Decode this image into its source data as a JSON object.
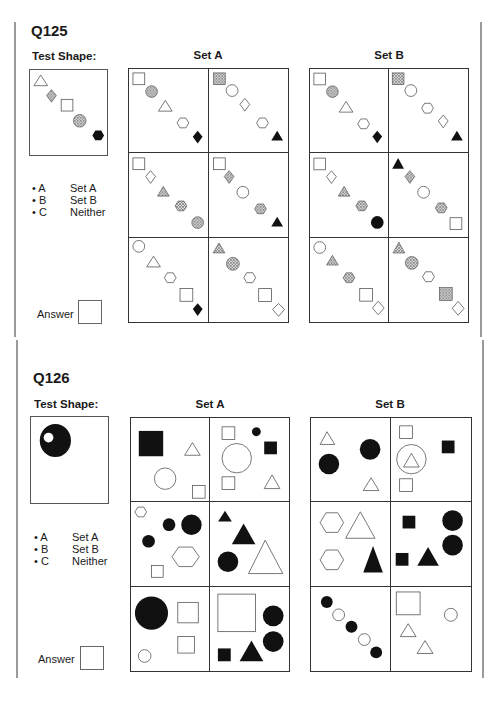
{
  "questions": [
    {
      "id": "Q125",
      "title": "Q125",
      "test_label": "Test Shape:",
      "set_a_label": "Set A",
      "set_b_label": "Set B",
      "test_shape": [
        "triangle-outline",
        "diamond-dotted",
        "square-outline",
        "circle-dotted",
        "hexagon-black"
      ],
      "set_a": [
        [
          "square-outline",
          "circle-dotted",
          "triangle-outline",
          "hexagon-outline",
          "diamond-black"
        ],
        [
          "square-dotted",
          "circle-outline",
          "diamond-outline",
          "hexagon-outline",
          "triangle-black"
        ],
        [
          "square-outline",
          "diamond-outline",
          "triangle-dotted",
          "hexagon-dotted",
          "circle-dotted"
        ],
        [
          "square-outline",
          "diamond-dotted",
          "circle-outline",
          "hexagon-dotted",
          "triangle-black"
        ],
        [
          "circle-outline",
          "triangle-outline",
          "hexagon-outline",
          "square-outline",
          "diamond-black"
        ],
        [
          "triangle-dotted",
          "circle-dotted",
          "hexagon-outline",
          "square-outline",
          "diamond-outline"
        ]
      ],
      "set_b": [
        [
          "square-outline",
          "circle-dotted",
          "triangle-outline",
          "hexagon-outline",
          "diamond-black"
        ],
        [
          "square-dotted",
          "circle-outline",
          "hexagon-outline",
          "diamond-outline",
          "triangle-black"
        ],
        [
          "square-outline",
          "diamond-outline",
          "triangle-dotted",
          "hexagon-dotted",
          "circle-black"
        ],
        [
          "triangle-black",
          "diamond-dotted",
          "circle-outline",
          "hexagon-dotted",
          "square-outline"
        ],
        [
          "circle-outline",
          "triangle-dotted",
          "hexagon-dotted",
          "square-outline",
          "diamond-outline"
        ],
        [
          "triangle-dotted",
          "circle-dotted",
          "hexagon-outline",
          "square-dotted",
          "diamond-outline"
        ]
      ],
      "options": [
        {
          "key": "• A",
          "text": "Set A"
        },
        {
          "key": "• B",
          "text": "Set B"
        },
        {
          "key": "• C",
          "text": "Neither"
        }
      ],
      "answer_label": "Answer",
      "answer_value": ""
    },
    {
      "id": "Q126",
      "title": "Q126",
      "test_label": "Test Shape:",
      "set_a_label": "Set A",
      "set_b_label": "Set B",
      "test_shape": [
        "black-circle-with-white-dot"
      ],
      "options": [
        {
          "key": "• A",
          "text": "Set A"
        },
        {
          "key": "• B",
          "text": "Set B"
        },
        {
          "key": "• C",
          "text": "Neither"
        }
      ],
      "answer_label": "Answer",
      "answer_value": ""
    }
  ],
  "colors": {
    "ink": "#1a1a1a",
    "border": "#333333",
    "rule": "#9a9a9a",
    "dotted_fill": "#8a8a8a"
  }
}
